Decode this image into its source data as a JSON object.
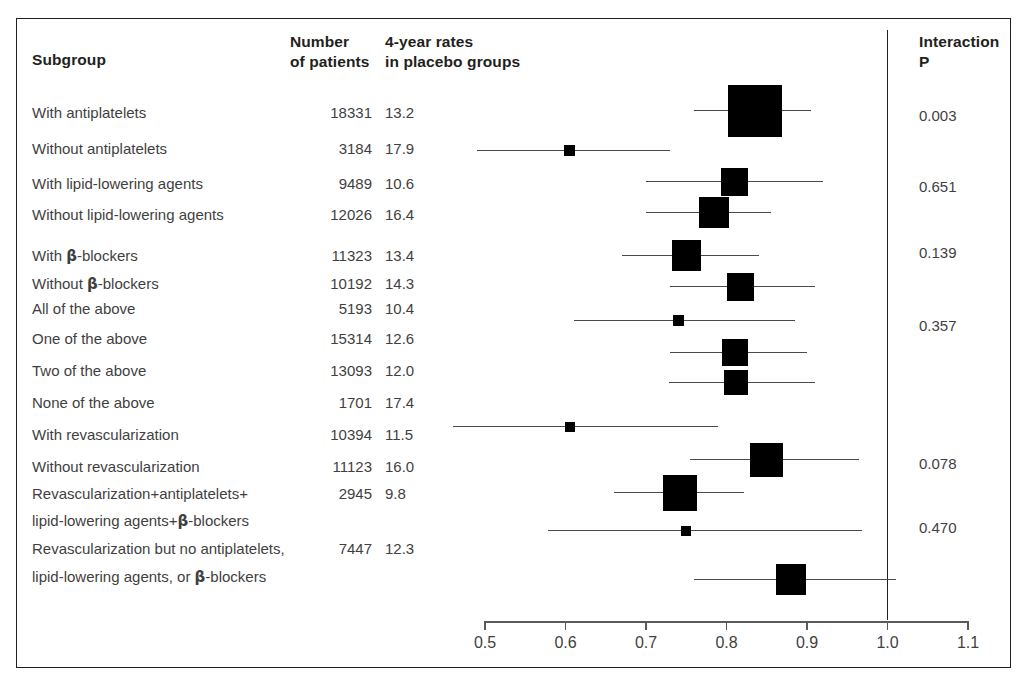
{
  "header": {
    "subgroup": "Subgroup",
    "number": "Number\nof patients",
    "rates": "4-year rates\nin placebo groups",
    "interaction": "Interaction\nP"
  },
  "axis": {
    "ticks": [
      "0.5",
      "0.6",
      "0.7",
      "0.8",
      "0.9",
      "1.0",
      "1.1"
    ],
    "min": 0.5,
    "max": 1.1,
    "null_value": "1.0"
  },
  "rows": [
    {
      "label": "With antiplatelets",
      "n": "18331",
      "rate": "13.2",
      "p": "0.003"
    },
    {
      "label": "Without antiplatelets",
      "n": "3184",
      "rate": "17.9",
      "p": ""
    },
    {
      "label": "With lipid-lowering agents",
      "n": "9489",
      "rate": "10.6",
      "p": "0.651"
    },
    {
      "label": "Without lipid-lowering agents",
      "n": "12026",
      "rate": "16.4",
      "p": ""
    },
    {
      "label": "With β-blockers",
      "n": "11323",
      "rate": "13.4",
      "p": "0.139"
    },
    {
      "label": "Without β-blockers",
      "n": "10192",
      "rate": "14.3",
      "p": ""
    },
    {
      "label": "All of the above",
      "n": "5193",
      "rate": "10.4",
      "p": ""
    },
    {
      "label": "One of the above",
      "n": "15314",
      "rate": "12.6",
      "p": "0.357"
    },
    {
      "label": "Two of the above",
      "n": "13093",
      "rate": "12.0",
      "p": ""
    },
    {
      "label": "None of the above",
      "n": "1701",
      "rate": "17.4",
      "p": ""
    },
    {
      "label": "With revascularization",
      "n": "10394",
      "rate": "11.5",
      "p": ""
    },
    {
      "label": "Without revascularization",
      "n": "11123",
      "rate": "16.0",
      "p": "0.078"
    },
    {
      "label": "Revascularization+antiplatelets+",
      "n": "2945",
      "rate": "9.8",
      "p": ""
    },
    {
      "label": "lipid-lowering agents+β-blockers",
      "n": "",
      "rate": "",
      "p": "0.470"
    },
    {
      "label": "Revascularization but no antiplatelets,",
      "n": "7447",
      "rate": "12.3",
      "p": ""
    },
    {
      "label": "lipid-lowering agents, or β-blockers",
      "n": "",
      "rate": "",
      "p": ""
    }
  ],
  "chart_data": {
    "type": "forest",
    "title": "",
    "xlabel": "",
    "ylabel": "",
    "xlim": [
      0.5,
      1.1
    ],
    "xticks": [
      0.5,
      0.6,
      0.7,
      0.8,
      0.9,
      1.0,
      1.1
    ],
    "reference_line": 1.0,
    "grid": false,
    "legend": "none",
    "colors": {
      "marker": "#000000",
      "ci": "#4a4a4a",
      "axis": "#5a5a5a",
      "text": "#3f3f3f"
    },
    "points": [
      {
        "subgroup": "With antiplatelets",
        "estimate": 0.835,
        "ci_low": 0.76,
        "ci_high": 0.905,
        "n": 18331,
        "placebo_rate": 13.2,
        "weight": 1.0,
        "interaction_p": 0.003
      },
      {
        "subgroup": "Without antiplatelets",
        "estimate": 0.605,
        "ci_low": 0.49,
        "ci_high": 0.73,
        "n": 3184,
        "placebo_rate": 17.9,
        "weight": 0.1,
        "interaction_p": null
      },
      {
        "subgroup": "With lipid-lowering agents",
        "estimate": 0.81,
        "ci_low": 0.7,
        "ci_high": 0.92,
        "n": 9489,
        "placebo_rate": 10.6,
        "weight": 0.45,
        "interaction_p": 0.651
      },
      {
        "subgroup": "Without lipid-lowering agents",
        "estimate": 0.785,
        "ci_low": 0.7,
        "ci_high": 0.855,
        "n": 12026,
        "placebo_rate": 16.4,
        "weight": 0.52,
        "interaction_p": null
      },
      {
        "subgroup": "With β-blockers",
        "estimate": 0.75,
        "ci_low": 0.67,
        "ci_high": 0.84,
        "n": 11323,
        "placebo_rate": 13.4,
        "weight": 0.5,
        "interaction_p": 0.139
      },
      {
        "subgroup": "Without β-blockers",
        "estimate": 0.818,
        "ci_low": 0.73,
        "ci_high": 0.91,
        "n": 10192,
        "placebo_rate": 14.3,
        "weight": 0.47,
        "interaction_p": null
      },
      {
        "subgroup": "All of the above",
        "estimate": 0.74,
        "ci_low": 0.61,
        "ci_high": 0.885,
        "n": 5193,
        "placebo_rate": 10.4,
        "weight": 0.09,
        "interaction_p": null
      },
      {
        "subgroup": "One of the above",
        "estimate": 0.81,
        "ci_low": 0.73,
        "ci_high": 0.9,
        "n": 15314,
        "placebo_rate": 12.6,
        "weight": 0.42,
        "interaction_p": 0.357
      },
      {
        "subgroup": "Two of the above",
        "estimate": 0.812,
        "ci_low": 0.728,
        "ci_high": 0.91,
        "n": 13093,
        "placebo_rate": 12.0,
        "weight": 0.4,
        "interaction_p": null
      },
      {
        "subgroup": "None of the above",
        "estimate": 0.605,
        "ci_low": 0.46,
        "ci_high": 0.79,
        "n": 1701,
        "placebo_rate": 17.4,
        "weight": 0.08,
        "interaction_p": null
      },
      {
        "subgroup": "With revascularization",
        "estimate": 0.85,
        "ci_low": 0.755,
        "ci_high": 0.965,
        "n": 10394,
        "placebo_rate": 11.5,
        "weight": 0.6,
        "interaction_p": 0.078
      },
      {
        "subgroup": "Without revascularization",
        "estimate": 0.742,
        "ci_low": 0.66,
        "ci_high": 0.822,
        "n": 11123,
        "placebo_rate": 16.0,
        "weight": 0.62,
        "interaction_p": null
      },
      {
        "subgroup": "Revascularization+antiplatelets+lipid-lowering agents+β-blockers",
        "estimate": 0.75,
        "ci_low": 0.578,
        "ci_high": 0.968,
        "n": 2945,
        "placebo_rate": 9.8,
        "weight": 0.08,
        "interaction_p": 0.47
      },
      {
        "subgroup": "Revascularization but no antiplatelets, lipid-lowering agents, or β-blockers",
        "estimate": 0.88,
        "ci_low": 0.76,
        "ci_high": 1.01,
        "n": 7447,
        "placebo_rate": 12.3,
        "weight": 0.5,
        "interaction_p": null
      }
    ]
  },
  "layout": {
    "marker_rows": [
      {
        "y": 110,
        "estimate": 0.835,
        "lo": 0.76,
        "hi": 0.905,
        "w": 54,
        "h": 52
      },
      {
        "y": 150,
        "estimate": 0.605,
        "lo": 0.49,
        "hi": 0.73,
        "w": 11,
        "h": 11
      },
      {
        "y": 181,
        "estimate": 0.81,
        "lo": 0.7,
        "hi": 0.92,
        "w": 27,
        "h": 28
      },
      {
        "y": 212,
        "estimate": 0.785,
        "lo": 0.7,
        "hi": 0.855,
        "w": 30,
        "h": 31
      },
      {
        "y": 255,
        "estimate": 0.75,
        "lo": 0.67,
        "hi": 0.84,
        "w": 29,
        "h": 31
      },
      {
        "y": 286,
        "estimate": 0.818,
        "lo": 0.73,
        "hi": 0.91,
        "w": 27,
        "h": 28
      },
      {
        "y": 320,
        "estimate": 0.74,
        "lo": 0.61,
        "hi": 0.885,
        "w": 11,
        "h": 11
      },
      {
        "y": 352,
        "estimate": 0.81,
        "lo": 0.73,
        "hi": 0.9,
        "w": 26,
        "h": 27
      },
      {
        "y": 382,
        "estimate": 0.812,
        "lo": 0.728,
        "hi": 0.91,
        "w": 24,
        "h": 25
      },
      {
        "y": 426,
        "estimate": 0.605,
        "lo": 0.46,
        "hi": 0.79,
        "w": 10,
        "h": 10
      },
      {
        "y": 459,
        "estimate": 0.85,
        "lo": 0.755,
        "hi": 0.965,
        "w": 33,
        "h": 34
      },
      {
        "y": 492,
        "estimate": 0.742,
        "lo": 0.66,
        "hi": 0.822,
        "w": 34,
        "h": 36
      },
      {
        "y": 530,
        "estimate": 0.75,
        "lo": 0.578,
        "hi": 0.968,
        "w": 10,
        "h": 10
      },
      {
        "y": 579,
        "estimate": 0.88,
        "lo": 0.76,
        "hi": 1.01,
        "w": 30,
        "h": 31
      }
    ],
    "label_rows": [
      {
        "y": 104,
        "i": 0
      },
      {
        "y": 140,
        "i": 1
      },
      {
        "y": 175,
        "i": 2
      },
      {
        "y": 206,
        "i": 3
      },
      {
        "y": 247,
        "i": 4
      },
      {
        "y": 275,
        "i": 5
      },
      {
        "y": 300,
        "i": 6
      },
      {
        "y": 330,
        "i": 7
      },
      {
        "y": 362,
        "i": 8
      },
      {
        "y": 394,
        "i": 9
      },
      {
        "y": 426,
        "i": 10
      },
      {
        "y": 458,
        "i": 11
      },
      {
        "y": 485,
        "i": 12
      },
      {
        "y": 512,
        "i": 13
      },
      {
        "y": 540,
        "i": 14
      },
      {
        "y": 568,
        "i": 15
      }
    ],
    "p_rows": [
      {
        "y": 107,
        "t": "0.003"
      },
      {
        "y": 178,
        "t": "0.651"
      },
      {
        "y": 244,
        "t": "0.139"
      },
      {
        "y": 317,
        "t": "0.357"
      },
      {
        "y": 455,
        "t": "0.078"
      },
      {
        "y": 519,
        "t": "0.470"
      }
    ]
  }
}
